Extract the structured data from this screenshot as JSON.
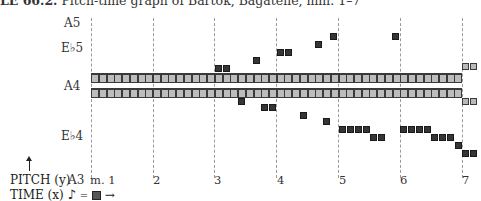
{
  "title": {
    "prefix": "LE 66.2.",
    "text": "Pitch-time graph of Bartók, Bagatelle, mm. 1–7"
  },
  "pitch_labels": [
    {
      "label": "A5",
      "x": 64,
      "y": 16
    },
    {
      "label": "E♭5",
      "x": 61,
      "y": 41
    },
    {
      "label": "A4",
      "x": 64,
      "y": 79
    },
    {
      "label": "E♭4",
      "x": 61,
      "y": 129
    },
    {
      "label": "A3",
      "x": 68,
      "y": 173
    }
  ],
  "measure_labels": [
    {
      "label": "m. 1",
      "x": 90
    },
    {
      "label": "2",
      "x": 153
    },
    {
      "label": "3",
      "x": 214
    },
    {
      "label": "4",
      "x": 277
    },
    {
      "label": "5",
      "x": 339
    },
    {
      "label": "6",
      "x": 400
    },
    {
      "label": "7",
      "x": 462
    }
  ],
  "grid_x": [
    91,
    153,
    214,
    276,
    338,
    400,
    462
  ],
  "bands": [
    {
      "name": "upper-a4-sustain",
      "x": 91,
      "y": 73,
      "w": 371,
      "cells": 48
    },
    {
      "name": "lower-a4-sustain",
      "x": 91,
      "y": 88,
      "w": 371,
      "cells": 48
    }
  ],
  "light_squares": [
    {
      "x": 462,
      "y": 63
    },
    {
      "x": 470,
      "y": 63
    },
    {
      "x": 462,
      "y": 98
    },
    {
      "x": 470,
      "y": 98
    }
  ],
  "dark_squares": [
    {
      "x": 215,
      "y": 65
    },
    {
      "x": 223,
      "y": 65
    },
    {
      "x": 253,
      "y": 57
    },
    {
      "x": 277,
      "y": 49
    },
    {
      "x": 285,
      "y": 49
    },
    {
      "x": 315,
      "y": 41
    },
    {
      "x": 330,
      "y": 33
    },
    {
      "x": 392,
      "y": 33
    },
    {
      "x": 238,
      "y": 98
    },
    {
      "x": 261,
      "y": 104
    },
    {
      "x": 269,
      "y": 104
    },
    {
      "x": 300,
      "y": 112
    },
    {
      "x": 323,
      "y": 118
    },
    {
      "x": 339,
      "y": 126
    },
    {
      "x": 347,
      "y": 126
    },
    {
      "x": 355,
      "y": 126
    },
    {
      "x": 363,
      "y": 126
    },
    {
      "x": 370,
      "y": 134
    },
    {
      "x": 378,
      "y": 134
    },
    {
      "x": 400,
      "y": 126
    },
    {
      "x": 408,
      "y": 126
    },
    {
      "x": 416,
      "y": 126
    },
    {
      "x": 424,
      "y": 126
    },
    {
      "x": 431,
      "y": 134
    },
    {
      "x": 439,
      "y": 134
    },
    {
      "x": 447,
      "y": 134
    },
    {
      "x": 455,
      "y": 142
    },
    {
      "x": 462,
      "y": 150
    },
    {
      "x": 470,
      "y": 150
    }
  ],
  "legend": {
    "pitch": "PITCH (y)",
    "time": "TIME (x)",
    "note_glyph": "♪",
    "equals": "=",
    "arrow": "→"
  }
}
